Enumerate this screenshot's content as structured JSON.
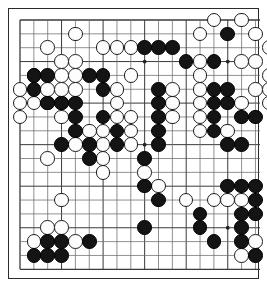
{
  "app": {
    "title": "Go Board Position",
    "board_size": 19,
    "colors": {
      "background": "#ffffff",
      "line": "#6b6b6b",
      "line_major": "#3a3a3a",
      "border": "#2b2b2b",
      "black_stone": "#141414",
      "white_stone": "#fdfdfd",
      "white_stone_border": "#1c1c1c",
      "star_point": "#222222"
    }
  },
  "geometry": {
    "origin_x": 11,
    "origin_y": 11,
    "spacing": 13.85,
    "stone_diameter": 14.6,
    "star_points": [
      [
        3,
        3
      ],
      [
        9,
        3
      ],
      [
        15,
        3
      ],
      [
        3,
        9
      ],
      [
        9,
        9
      ],
      [
        15,
        9
      ],
      [
        3,
        15
      ],
      [
        9,
        15
      ],
      [
        15,
        15
      ]
    ]
  },
  "position": {
    "black_label": "Black",
    "white_label": "White",
    "black_stones": [
      [
        1,
        4
      ],
      [
        2,
        4
      ],
      [
        5,
        4
      ],
      [
        6,
        4
      ],
      [
        12,
        3
      ],
      [
        14,
        3
      ],
      [
        10,
        2
      ],
      [
        11,
        2
      ],
      [
        9,
        2
      ],
      [
        15,
        1
      ],
      [
        1,
        5
      ],
      [
        6,
        5
      ],
      [
        10,
        5
      ],
      [
        14,
        5
      ],
      [
        15,
        5
      ],
      [
        2,
        6
      ],
      [
        3,
        6
      ],
      [
        4,
        6
      ],
      [
        10,
        6
      ],
      [
        14,
        6
      ],
      [
        15,
        6
      ],
      [
        4,
        7
      ],
      [
        6,
        7
      ],
      [
        10,
        7
      ],
      [
        14,
        7
      ],
      [
        16,
        7
      ],
      [
        17,
        7
      ],
      [
        4,
        8
      ],
      [
        7,
        8
      ],
      [
        10,
        8
      ],
      [
        14,
        8
      ],
      [
        3,
        9
      ],
      [
        5,
        9
      ],
      [
        7,
        9
      ],
      [
        10,
        9
      ],
      [
        15,
        9
      ],
      [
        16,
        9
      ],
      [
        5,
        10
      ],
      [
        9,
        10
      ],
      [
        9,
        12
      ],
      [
        15,
        12
      ],
      [
        16,
        12
      ],
      [
        17,
        12
      ],
      [
        10,
        13
      ],
      [
        17,
        13
      ],
      [
        13,
        14
      ],
      [
        16,
        14
      ],
      [
        17,
        14
      ],
      [
        9,
        15
      ],
      [
        13,
        15
      ],
      [
        16,
        15
      ],
      [
        2,
        16
      ],
      [
        3,
        16
      ],
      [
        5,
        16
      ],
      [
        14,
        16
      ],
      [
        16,
        16
      ],
      [
        1,
        17
      ],
      [
        2,
        17
      ],
      [
        3,
        17
      ],
      [
        17,
        17
      ]
    ],
    "white_stones": [
      [
        14,
        0
      ],
      [
        16,
        0
      ],
      [
        4,
        1
      ],
      [
        13,
        1
      ],
      [
        17,
        1
      ],
      [
        2,
        2
      ],
      [
        6,
        2
      ],
      [
        7,
        2
      ],
      [
        8,
        2
      ],
      [
        18,
        2
      ],
      [
        3,
        3
      ],
      [
        4,
        3
      ],
      [
        13,
        3
      ],
      [
        16,
        3
      ],
      [
        17,
        3
      ],
      [
        1,
        4
      ],
      [
        3,
        4
      ],
      [
        4,
        4
      ],
      [
        8,
        4
      ],
      [
        13,
        4
      ],
      [
        18,
        4
      ],
      [
        0,
        5
      ],
      [
        2,
        5
      ],
      [
        3,
        5
      ],
      [
        4,
        5
      ],
      [
        7,
        5
      ],
      [
        11,
        5
      ],
      [
        13,
        5
      ],
      [
        17,
        5
      ],
      [
        18,
        5
      ],
      [
        0,
        6
      ],
      [
        1,
        6
      ],
      [
        2,
        6
      ],
      [
        3,
        6
      ],
      [
        7,
        6
      ],
      [
        11,
        6
      ],
      [
        13,
        6
      ],
      [
        16,
        6
      ],
      [
        18,
        6
      ],
      [
        0,
        7
      ],
      [
        3,
        7
      ],
      [
        7,
        7
      ],
      [
        8,
        7
      ],
      [
        11,
        7
      ],
      [
        13,
        7
      ],
      [
        5,
        8
      ],
      [
        6,
        8
      ],
      [
        8,
        8
      ],
      [
        13,
        8
      ],
      [
        15,
        8
      ],
      [
        4,
        9
      ],
      [
        6,
        9
      ],
      [
        8,
        9
      ],
      [
        2,
        10
      ],
      [
        6,
        10
      ],
      [
        6,
        11
      ],
      [
        9,
        11
      ],
      [
        10,
        12
      ],
      [
        3,
        13
      ],
      [
        12,
        13
      ],
      [
        14,
        13
      ],
      [
        15,
        13
      ],
      [
        16,
        13
      ],
      [
        2,
        15
      ],
      [
        3,
        15
      ],
      [
        1,
        16
      ],
      [
        4,
        16
      ],
      [
        17,
        16
      ],
      [
        16,
        17
      ]
    ]
  }
}
